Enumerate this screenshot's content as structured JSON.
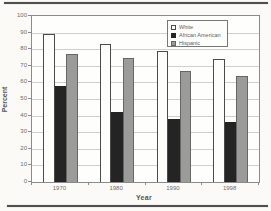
{
  "page": {
    "background": "#fbfaf7",
    "decorations": [
      "top-rule",
      "bottom-rule"
    ]
  },
  "chart_data": {
    "type": "bar",
    "title": "",
    "xlabel": "Year",
    "ylabel": "Percent",
    "categories": [
      "1970",
      "1980",
      "1990",
      "1998"
    ],
    "series": [
      {
        "name": "White",
        "color": "#fdfdfc",
        "border": "#4a4a4a",
        "values": [
          89,
          83,
          79,
          74
        ]
      },
      {
        "name": "African American",
        "color": "#242424",
        "border": "#242424",
        "values": [
          58,
          42,
          38,
          36
        ]
      },
      {
        "name": "Hispanic",
        "color": "#9b9b99",
        "border": "#666666",
        "values": [
          77,
          75,
          67,
          64
        ]
      }
    ],
    "ylim": [
      0,
      100
    ],
    "ytick_step": 10,
    "yticks": [
      "0",
      "10",
      "20",
      "30",
      "40",
      "50",
      "60",
      "70",
      "80",
      "90",
      "100"
    ],
    "grid": true,
    "legend_position": "top-right",
    "axis_color": "#8a8a8a",
    "gridline_color": "#cfcfcb"
  }
}
